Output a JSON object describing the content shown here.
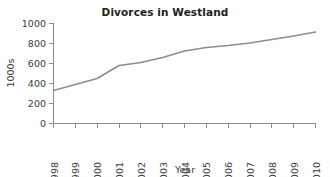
{
  "chart_data": {
    "type": "line",
    "title": "Divorces in Westland",
    "xlabel": "Year",
    "ylabel": "1000s",
    "categories": [
      "1998",
      "1999",
      "2000",
      "2001",
      "2002",
      "2003",
      "2004",
      "2005",
      "2006",
      "2007",
      "2008",
      "2009",
      "2010"
    ],
    "x": [
      1998,
      1999,
      2000,
      2001,
      2002,
      2003,
      2004,
      2005,
      2006,
      2007,
      2008,
      2009,
      2010
    ],
    "values": [
      330,
      390,
      450,
      580,
      610,
      660,
      725,
      760,
      780,
      805,
      840,
      875,
      915
    ],
    "series": [
      {
        "name": "Divorces",
        "values": [
          330,
          390,
          450,
          580,
          610,
          660,
          725,
          760,
          780,
          805,
          840,
          875,
          915
        ]
      }
    ],
    "xlim": [
      1998,
      2010
    ],
    "ylim": [
      0,
      1000
    ],
    "ytick_labels": [
      "0",
      "200",
      "400",
      "600",
      "800",
      "1000"
    ],
    "ytick_values": [
      0,
      200,
      400,
      600,
      800,
      1000
    ],
    "grid": false,
    "legend": false,
    "line_color": "#8d8d8d",
    "axis_color": "#8c8c8c",
    "text_color": "#3a3a3a",
    "title_color": "#222222",
    "background": "#ffffff"
  }
}
